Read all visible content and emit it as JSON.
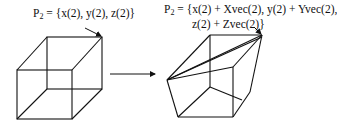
{
  "left_figure": {
    "label_prefix": "P",
    "label_subscript": "2",
    "label_text": " = {x(2), y(2), z(2)}"
  },
  "right_figure": {
    "label_prefix": "P",
    "label_subscript": "2",
    "label_line1": " = {x(2) + Xvec(2), y(2) + Yvec(2),",
    "label_line2": "z(2) + Zvec(2)}"
  },
  "transform_arrow": {
    "direction": "right"
  },
  "colors": {
    "stroke": "#111111",
    "background": "#ffffff"
  }
}
